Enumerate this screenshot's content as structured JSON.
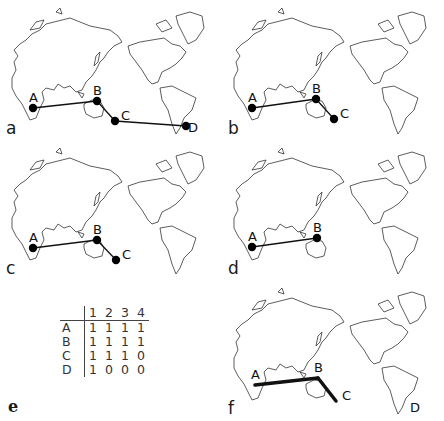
{
  "figure": {
    "panels": [
      {
        "id": "a",
        "letter": "a",
        "x": 0,
        "y": 0,
        "nodes": [
          {
            "label": "A",
            "x": 33,
            "y": 108,
            "dot": true
          },
          {
            "label": "B",
            "x": 97,
            "y": 101,
            "dot": true
          },
          {
            "label": "C",
            "x": 115,
            "y": 121,
            "dot": true
          },
          {
            "label": "D",
            "x": 186,
            "y": 126,
            "dot": true
          }
        ],
        "edges": [
          [
            "A",
            "B"
          ],
          [
            "B",
            "C"
          ],
          [
            "C",
            "D"
          ]
        ],
        "edge_width": 1.3
      },
      {
        "id": "b",
        "letter": "b",
        "x": 222,
        "y": 0,
        "nodes": [
          {
            "label": "A",
            "x": 30,
            "y": 108,
            "dot": true
          },
          {
            "label": "B",
            "x": 94,
            "y": 99,
            "dot": true
          },
          {
            "label": "C",
            "x": 112,
            "y": 119,
            "dot": true
          }
        ],
        "edges": [
          [
            "A",
            "B"
          ],
          [
            "B",
            "C"
          ]
        ],
        "edge_width": 1.3
      },
      {
        "id": "c",
        "letter": "c",
        "x": 0,
        "y": 140,
        "nodes": [
          {
            "label": "A",
            "x": 33,
            "y": 108,
            "dot": true
          },
          {
            "label": "B",
            "x": 97,
            "y": 100,
            "dot": true
          },
          {
            "label": "C",
            "x": 116,
            "y": 120,
            "dot": true
          }
        ],
        "edges": [
          [
            "A",
            "B"
          ],
          [
            "B",
            "C"
          ]
        ],
        "edge_width": 1.3
      },
      {
        "id": "d",
        "letter": "d",
        "x": 222,
        "y": 140,
        "nodes": [
          {
            "label": "A",
            "x": 30,
            "y": 107,
            "dot": true
          },
          {
            "label": "B",
            "x": 95,
            "y": 98,
            "dot": true
          }
        ],
        "edges": [
          [
            "A",
            "B"
          ]
        ],
        "edge_width": 1.3
      },
      {
        "id": "f",
        "letter": "f",
        "x": 222,
        "y": 280,
        "nodes": [
          {
            "label": "A",
            "x": 33,
            "y": 105,
            "dot": false
          },
          {
            "label": "B",
            "x": 96,
            "y": 98,
            "dot": false
          },
          {
            "label": "C",
            "x": 114,
            "y": 121,
            "dot": false
          },
          {
            "label": "D",
            "x": 186,
            "y": 126,
            "dot": false
          }
        ],
        "edges": [
          [
            "A",
            "B"
          ],
          [
            "B",
            "C"
          ]
        ],
        "edge_width": 3.5
      }
    ],
    "table_panel": {
      "letter": "e",
      "columns": [
        "1",
        "2",
        "3",
        "4"
      ],
      "rows": [
        {
          "label": "A",
          "values": [
            "1",
            "1",
            "1",
            "1"
          ]
        },
        {
          "label": "B",
          "values": [
            "1",
            "1",
            "1",
            "1"
          ]
        },
        {
          "label": "C",
          "values": [
            "1",
            "1",
            "1",
            "0"
          ]
        },
        {
          "label": "D",
          "values": [
            "1",
            "0",
            "0",
            "0"
          ]
        }
      ]
    }
  }
}
